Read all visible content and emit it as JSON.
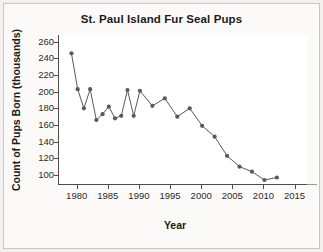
{
  "figure": {
    "background_color": "#f2f1ef",
    "plot_background_color": "#ffffff",
    "axis_color": "#4d4d4d",
    "series_color": "#595959"
  },
  "chart_data": {
    "type": "line",
    "title": "St. Paul Island Fur Seal Pups",
    "xlabel": "Year",
    "ylabel": "Count of Pups Born (thousands)",
    "xlim": [
      1977,
      2017
    ],
    "ylim": [
      88,
      268
    ],
    "grid": false,
    "legend": null,
    "markers": "filled-circle",
    "xticks": [
      1980,
      1985,
      1990,
      1995,
      2000,
      2005,
      2010,
      2015
    ],
    "xtick_labels": [
      "1980",
      "1985",
      "1990",
      "1995",
      "2000",
      "2005",
      "2010",
      "2015"
    ],
    "yticks": [
      100,
      120,
      140,
      160,
      180,
      200,
      220,
      240,
      260
    ],
    "ytick_labels": [
      "100",
      "120",
      "140",
      "160",
      "180",
      "200",
      "220",
      "240",
      "260"
    ],
    "x": [
      1979,
      1980,
      1981,
      1982,
      1983,
      1984,
      1985,
      1986,
      1987,
      1988,
      1989,
      1990,
      1992,
      1994,
      1996,
      1998,
      2000,
      2002,
      2004,
      2006,
      2008,
      2010,
      2012
    ],
    "values": [
      246,
      203,
      180,
      203,
      166,
      173,
      182,
      168,
      171,
      202,
      171,
      201,
      183,
      192,
      170,
      180,
      159,
      146,
      123,
      110,
      104,
      94,
      97
    ],
    "series": [
      {
        "name": "Count of Pups Born (thousands)",
        "values": [
          246,
          203,
          180,
          203,
          166,
          173,
          182,
          168,
          171,
          202,
          171,
          201,
          183,
          192,
          170,
          180,
          159,
          146,
          123,
          110,
          104,
          94,
          97
        ]
      }
    ]
  }
}
